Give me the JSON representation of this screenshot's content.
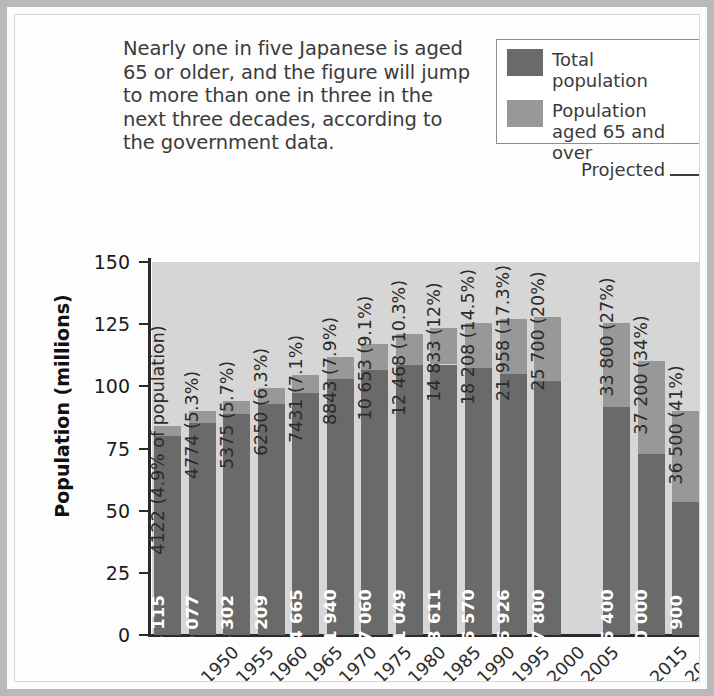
{
  "caption": "Nearly one in five Japanese is aged 65 or older, and the figure will jump to more than one in three in the next three decades, according to the government data.",
  "legend": {
    "items": [
      {
        "label": "Total population",
        "color": "#6a6a6a",
        "swatch_name": "legend-swatch-total"
      },
      {
        "label": "Population aged 65 and over",
        "color": "#989898",
        "swatch_name": "legend-swatch-elderly"
      }
    ]
  },
  "annotations": {
    "projected": "Projected",
    "projected_arrow": "arrow-right-icon"
  },
  "axes": {
    "ylabel": "Population (millions)",
    "xlabel": "Year",
    "yticks": [
      "0",
      "25",
      "50",
      "75",
      "100",
      "125",
      "150"
    ]
  },
  "colors": {
    "total_population": "#6a6a6a",
    "elderly_population": "#989898",
    "plot_background": "#d6d6d6",
    "axis": "#2a2a2a",
    "frame": "#b9b9b9",
    "text": "#2b2b2b",
    "inbar_text": "#ffffff"
  },
  "chart_data": {
    "type": "bar",
    "subtype": "stacked",
    "title": "",
    "xlabel": "Year",
    "ylabel": "Population (millions)",
    "ylim": [
      0,
      150
    ],
    "ytick_step": 25,
    "grid": false,
    "legend_position": "top-right",
    "units_note": "bar value labels are in thousands; axis is in millions",
    "categories": [
      "1950",
      "1955",
      "1960",
      "1965",
      "1970",
      "1975",
      "1980",
      "1985",
      "1990",
      "1995",
      "2000",
      "2005",
      "",
      "2015",
      "2035",
      "2055"
    ],
    "projected_from": "2015",
    "series": [
      {
        "name": "Total population",
        "values": [
          84115,
          90077,
          94302,
          99209,
          104665,
          111940,
          117060,
          121049,
          123611,
          125570,
          126926,
          127800,
          null,
          125400,
          110000,
          89900
        ]
      },
      {
        "name": "Population aged 65 and over",
        "values": [
          4122,
          4774,
          5375,
          6250,
          7431,
          8843,
          10653,
          12468,
          14833,
          18208,
          21958,
          25700,
          null,
          33800,
          37200,
          36500
        ]
      }
    ],
    "bars": [
      {
        "year": "1950",
        "total": 84115,
        "total_label": "84 115",
        "elderly": 4122,
        "elderly_pct": "4.9%",
        "above_label": "4122 (4.9% of population)"
      },
      {
        "year": "1955",
        "total": 90077,
        "total_label": "90 077",
        "elderly": 4774,
        "elderly_pct": "5.3%",
        "above_label": "4774 (5.3%)"
      },
      {
        "year": "1960",
        "total": 94302,
        "total_label": "94 302",
        "elderly": 5375,
        "elderly_pct": "5.7%",
        "above_label": "5375 (5.7%)"
      },
      {
        "year": "1965",
        "total": 99209,
        "total_label": "99 209",
        "elderly": 6250,
        "elderly_pct": "6.3%",
        "above_label": "6250 (6.3%)"
      },
      {
        "year": "1970",
        "total": 104665,
        "total_label": "104 665",
        "elderly": 7431,
        "elderly_pct": "7.1%",
        "above_label": "7431 (7.1%)"
      },
      {
        "year": "1975",
        "total": 111940,
        "total_label": "111 940",
        "elderly": 8843,
        "elderly_pct": "7.9%",
        "above_label": "8843 (7.9%)"
      },
      {
        "year": "1980",
        "total": 117060,
        "total_label": "117 060",
        "elderly": 10653,
        "elderly_pct": "9.1%",
        "above_label": "10 653 (9.1%)"
      },
      {
        "year": "1985",
        "total": 121049,
        "total_label": "121 049",
        "elderly": 12468,
        "elderly_pct": "10.3%",
        "above_label": "12 468 (10.3%)"
      },
      {
        "year": "1990",
        "total": 123611,
        "total_label": "123 611",
        "elderly": 14833,
        "elderly_pct": "12%",
        "above_label": "14 833 (12%)"
      },
      {
        "year": "1995",
        "total": 125570,
        "total_label": "125 570",
        "elderly": 18208,
        "elderly_pct": "14.5%",
        "above_label": "18 208 (14.5%)"
      },
      {
        "year": "2000",
        "total": 126926,
        "total_label": "126 926",
        "elderly": 21958,
        "elderly_pct": "17.3%",
        "above_label": "21 958 (17.3%)"
      },
      {
        "year": "2005",
        "total": 127800,
        "total_label": "127 800",
        "elderly": 25700,
        "elderly_pct": "20%",
        "above_label": "25 700 (20%)"
      },
      {
        "year": "2015",
        "total": 125400,
        "total_label": "125 400",
        "elderly": 33800,
        "elderly_pct": "27%",
        "above_label": "33 800 (27%)"
      },
      {
        "year": "2035",
        "total": 110000,
        "total_label": "110 000",
        "elderly": 37200,
        "elderly_pct": "34%",
        "above_label": "37 200 (34%)"
      },
      {
        "year": "2055",
        "total": 89900,
        "total_label": "89 900",
        "elderly": 36500,
        "elderly_pct": "41%",
        "above_label": "36 500 (41%)"
      }
    ]
  }
}
